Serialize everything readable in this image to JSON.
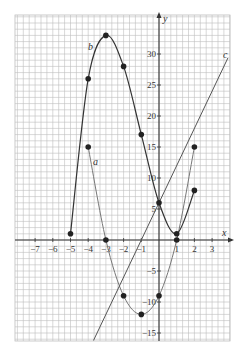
{
  "chart_data": {
    "type": "line",
    "title": "",
    "xlabel": "x",
    "ylabel": "y",
    "xlim": [
      -8,
      4
    ],
    "ylim": [
      -16,
      36
    ],
    "grid": true,
    "x_ticks": [
      -7,
      -6,
      -5,
      -4,
      -3,
      -2,
      -1,
      1,
      2,
      3
    ],
    "x_tick_labels": [
      "−7",
      "−6",
      "−5",
      "−4",
      "−3",
      "−2",
      "−1",
      "1",
      "2",
      "3"
    ],
    "y_ticks": [
      -15,
      -10,
      -5,
      5,
      10,
      15,
      20,
      25,
      30
    ],
    "y_tick_labels": [
      "−15",
      "−10",
      "−5",
      "5",
      "10",
      "15",
      "20",
      "25",
      "30"
    ],
    "series": [
      {
        "name": "a",
        "label": "a",
        "x": [
          -4,
          -3,
          -2,
          -1,
          0,
          1,
          2
        ],
        "y": [
          15,
          0,
          -9,
          -12,
          -9,
          0,
          15
        ],
        "markers": true,
        "color": "#777777"
      },
      {
        "name": "b",
        "label": "b",
        "x": [
          -5,
          -4,
          -3,
          -2,
          -1,
          0,
          1,
          2
        ],
        "y": [
          1,
          26,
          33,
          28,
          17,
          6,
          1,
          8
        ],
        "markers": true,
        "color": "#333333"
      },
      {
        "name": "c",
        "label": "c",
        "equation": "y = 6x + 6",
        "x": [
          -3.7,
          3.9
        ],
        "y": [
          -16.2,
          29.4
        ],
        "markers_at": {
          "x": [
            -1,
            0,
            1
          ],
          "y": [
            0,
            6,
            12
          ]
        },
        "color": "#555555"
      }
    ]
  },
  "axes": {
    "x_label": "x",
    "y_label": "y"
  },
  "labels": {
    "a": "a",
    "b": "b",
    "c": "c"
  }
}
